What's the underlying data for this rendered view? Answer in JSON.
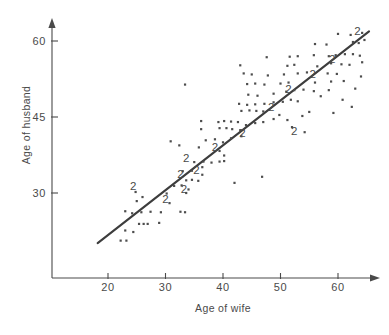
{
  "chart_data": {
    "type": "scatter",
    "title": "",
    "xlabel": "Age of wife",
    "ylabel": "Age of husband",
    "xlim": [
      14,
      66
    ],
    "ylim": [
      18,
      64
    ],
    "xticks": [
      20,
      30,
      40,
      50,
      60
    ],
    "yticks": [
      30,
      45,
      60
    ],
    "grid": false,
    "legend": null,
    "series": [
      {
        "name": "couples",
        "marker": "dot",
        "points": [
          [
            22.2,
            20.6
          ],
          [
            23.2,
            20.6
          ],
          [
            23.0,
            22.6
          ],
          [
            24.4,
            22.3
          ],
          [
            25.4,
            23.9
          ],
          [
            26.2,
            23.9
          ],
          [
            26.9,
            23.9
          ],
          [
            28.9,
            24.1
          ],
          [
            23.0,
            26.4
          ],
          [
            24.2,
            26.0
          ],
          [
            25.8,
            26.2
          ],
          [
            27.4,
            26.3
          ],
          [
            29.2,
            26.2
          ],
          [
            32.6,
            26.3
          ],
          [
            33.4,
            26.2
          ],
          [
            30.7,
            28.0
          ],
          [
            25.0,
            28.4
          ],
          [
            24.8,
            30.2
          ],
          [
            26.0,
            29.2
          ],
          [
            30.2,
            29.9
          ],
          [
            33.6,
            30.0
          ],
          [
            34.0,
            30.7
          ],
          [
            31.5,
            31.4
          ],
          [
            32.8,
            31.5
          ],
          [
            33.6,
            32.5
          ],
          [
            34.6,
            32.6
          ],
          [
            35.7,
            32.4
          ],
          [
            36.4,
            33.6
          ],
          [
            33.0,
            34.3
          ],
          [
            34.6,
            34.4
          ],
          [
            36.4,
            35.1
          ],
          [
            35.0,
            36.1
          ],
          [
            36.6,
            36.2
          ],
          [
            38.0,
            36.0
          ],
          [
            39.4,
            36.2
          ],
          [
            40.2,
            36.3
          ],
          [
            40.2,
            37.4
          ],
          [
            39.4,
            38.3
          ],
          [
            32.4,
            39.4
          ],
          [
            35.8,
            39.0
          ],
          [
            30.9,
            40.2
          ],
          [
            37.0,
            40.4
          ],
          [
            38.6,
            40.6
          ],
          [
            40.0,
            40.0
          ],
          [
            41.4,
            40.8
          ],
          [
            43.2,
            41.2
          ],
          [
            36.2,
            42.6
          ],
          [
            39.4,
            42.8
          ],
          [
            40.6,
            42.8
          ],
          [
            41.6,
            42.6
          ],
          [
            43.0,
            42.4
          ],
          [
            36.2,
            44.2
          ],
          [
            39.2,
            44.0
          ],
          [
            40.2,
            44.2
          ],
          [
            41.4,
            44.1
          ],
          [
            42.6,
            44.0
          ],
          [
            44.0,
            43.4
          ],
          [
            45.6,
            43.8
          ],
          [
            47.0,
            44.0
          ],
          [
            48.8,
            44.6
          ],
          [
            51.2,
            44.4
          ],
          [
            49.8,
            45.4
          ],
          [
            43.2,
            46.2
          ],
          [
            44.6,
            46.3
          ],
          [
            45.8,
            46.2
          ],
          [
            47.0,
            46.1
          ],
          [
            42.8,
            47.6
          ],
          [
            44.2,
            47.4
          ],
          [
            45.6,
            47.5
          ],
          [
            47.2,
            47.6
          ],
          [
            48.8,
            47.9
          ],
          [
            50.4,
            48.0
          ],
          [
            51.8,
            48.4
          ],
          [
            53.0,
            48.1
          ],
          [
            44.4,
            49.4
          ],
          [
            46.0,
            49.2
          ],
          [
            48.8,
            49.6
          ],
          [
            51.0,
            50.0
          ],
          [
            52.4,
            50.3
          ],
          [
            54.0,
            50.4
          ],
          [
            55.8,
            50.1
          ],
          [
            58.4,
            50.3
          ],
          [
            57.0,
            49.1
          ],
          [
            33.4,
            51.4
          ],
          [
            44.2,
            51.5
          ],
          [
            45.6,
            51.6
          ],
          [
            47.2,
            51.4
          ],
          [
            50.0,
            51.6
          ],
          [
            51.4,
            51.8
          ],
          [
            56.0,
            51.8
          ],
          [
            58.8,
            52.0
          ],
          [
            61.0,
            52.1
          ],
          [
            43.6,
            53.6
          ],
          [
            45.0,
            53.4
          ],
          [
            47.8,
            53.2
          ],
          [
            50.6,
            53.4
          ],
          [
            53.0,
            53.6
          ],
          [
            54.6,
            53.8
          ],
          [
            58.2,
            53.6
          ],
          [
            59.8,
            53.5
          ],
          [
            43.0,
            55.2
          ],
          [
            51.2,
            55.1
          ],
          [
            52.4,
            55.3
          ],
          [
            56.4,
            55.0
          ],
          [
            58.8,
            55.6
          ],
          [
            60.6,
            55.4
          ],
          [
            62.0,
            55.3
          ],
          [
            47.6,
            56.8
          ],
          [
            51.6,
            56.9
          ],
          [
            53.0,
            57.0
          ],
          [
            55.8,
            57.2
          ],
          [
            58.4,
            57.0
          ],
          [
            59.6,
            57.2
          ],
          [
            61.2,
            57.4
          ],
          [
            62.6,
            57.4
          ],
          [
            63.8,
            57.1
          ],
          [
            56.0,
            59.4
          ],
          [
            58.0,
            59.3
          ],
          [
            62.6,
            59.8
          ],
          [
            63.6,
            59.6
          ],
          [
            60.0,
            61.4
          ],
          [
            62.2,
            61.2
          ],
          [
            64.2,
            61.6
          ],
          [
            64.6,
            60.2
          ],
          [
            46.8,
            33.2
          ],
          [
            42.0,
            32.0
          ],
          [
            60.8,
            48.4
          ],
          [
            62.4,
            47.0
          ],
          [
            63.0,
            50.6
          ],
          [
            64.0,
            53.0
          ],
          [
            64.2,
            55.8
          ],
          [
            59.2,
            45.8
          ],
          [
            55.0,
            46.0
          ],
          [
            53.8,
            45.2
          ],
          [
            52.0,
            43.0
          ],
          [
            54.2,
            42.0
          ]
        ]
      }
    ],
    "overlap_markers": {
      "label": "2",
      "note": "a '2' denotes two coincident observations",
      "points": [
        [
          24.4,
          31.2
        ],
        [
          30.0,
          28.6
        ],
        [
          33.2,
          30.6
        ],
        [
          32.6,
          33.6
        ],
        [
          33.6,
          36.8
        ],
        [
          35.4,
          34.4
        ],
        [
          38.6,
          38.8
        ],
        [
          43.4,
          41.6
        ],
        [
          48.4,
          46.8
        ],
        [
          52.4,
          42.0
        ],
        [
          51.4,
          50.4
        ],
        [
          55.6,
          53.2
        ],
        [
          59.0,
          56.2
        ],
        [
          63.4,
          61.8
        ]
      ]
    },
    "fit_line": {
      "x0": 18.2,
      "y0": 20.1,
      "x1": 65.4,
      "y1": 61.9,
      "style": "solid"
    }
  },
  "axes": {
    "x_title": "Age of wife",
    "y_title": "Age of husband",
    "x_tick_labels": [
      "20",
      "30",
      "40",
      "50",
      "60"
    ],
    "y_tick_labels": [
      "30",
      "45",
      "60"
    ]
  },
  "colors": {
    "axis": "#4a4a4a",
    "point": "#4d4d4d",
    "line": "#3d3d3d",
    "background": "#ffffff",
    "text": "#4a4a4a"
  }
}
